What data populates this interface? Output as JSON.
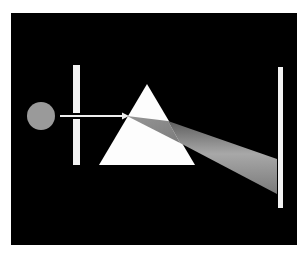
{
  "diagram": {
    "background": "#000000",
    "page_background": "#ffffff",
    "frame": {
      "x": 11,
      "y": 13,
      "width": 286,
      "height": 232
    },
    "light_source": {
      "cx": 41,
      "cy": 116,
      "r": 14,
      "color": "#9a9a9a"
    },
    "slit": {
      "x": 73,
      "y": 65,
      "width": 7,
      "height": 100,
      "color": "#f2f2f2",
      "gap_y": 116
    },
    "incident_ray": {
      "x1": 60,
      "y1": 116,
      "x2": 128,
      "y2": 116,
      "color": "#eeeeee"
    },
    "prism": {
      "points": "147,84 99,165 195,165",
      "color": "#fdfdfd"
    },
    "beam": {
      "inside_points": "127,116 168,121 180,143",
      "outside_points": "168,121 277,159 277,194 180,143",
      "color_light": "#b0b0b0",
      "color_dark": "#6a6a6a"
    },
    "screen": {
      "x": 278,
      "y": 67,
      "width": 5,
      "height": 141,
      "color": "#f2f2f2"
    }
  }
}
